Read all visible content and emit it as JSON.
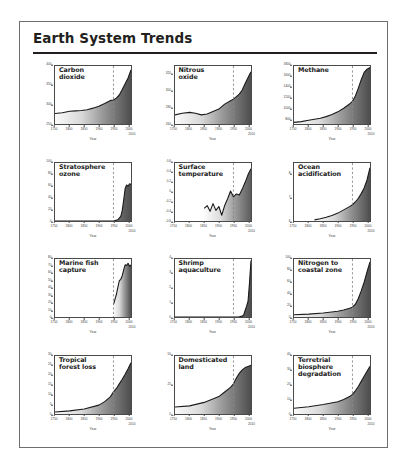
{
  "panel": {
    "title": "Earth System Trends"
  },
  "axis_common": {
    "xlabel": "Year",
    "xticks": [
      "1750",
      "1800",
      "1850",
      "1900",
      "1950",
      "2000"
    ],
    "xtick_values": [
      1750,
      1800,
      1850,
      1900,
      1950,
      2000
    ],
    "xlim": [
      1750,
      2010
    ],
    "x_end_label": "2010",
    "acceleration_marker_year": 1950
  },
  "chart_data": [
    {
      "type": "area",
      "title": "Carbon\ndioxide",
      "ylabel": "Atmospheric conc., ppm",
      "xlabel": "Year",
      "ylim": [
        250,
        400
      ],
      "yticks": [
        250,
        300,
        350,
        400
      ],
      "xlim": [
        1750,
        2010
      ],
      "x": [
        1750,
        1775,
        1800,
        1820,
        1840,
        1860,
        1880,
        1900,
        1920,
        1940,
        1950,
        1960,
        1970,
        1980,
        1990,
        2000,
        2010
      ],
      "values": [
        277,
        279,
        283,
        284,
        285,
        287,
        291,
        296,
        303,
        311,
        312,
        317,
        325,
        339,
        354,
        369,
        390
      ],
      "grid": false
    },
    {
      "type": "area",
      "title": "Nitrous\noxide",
      "ylabel": "Atmospheric conc., ppb",
      "xlabel": "Year",
      "ylim": [
        260,
        330
      ],
      "yticks": [
        260,
        280,
        300,
        320
      ],
      "xlim": [
        1750,
        2010
      ],
      "x": [
        1750,
        1775,
        1800,
        1820,
        1840,
        1860,
        1880,
        1900,
        1920,
        1940,
        1950,
        1960,
        1970,
        1980,
        1990,
        2000,
        2010
      ],
      "values": [
        271,
        273,
        274,
        273,
        271,
        272,
        275,
        278,
        284,
        288,
        290,
        293,
        296,
        301,
        309,
        316,
        323
      ],
      "grid": false
    },
    {
      "type": "area",
      "title": "Methane",
      "ylabel": "Atmospheric conc., ppb",
      "xlabel": "Year",
      "ylim": [
        700,
        1800
      ],
      "yticks": [
        800,
        1000,
        1200,
        1400,
        1600,
        1800
      ],
      "xlim": [
        1750,
        2010
      ],
      "x": [
        1750,
        1775,
        1800,
        1820,
        1840,
        1860,
        1880,
        1900,
        1920,
        1940,
        1950,
        1960,
        1970,
        1980,
        1990,
        2000,
        2010
      ],
      "values": [
        730,
        745,
        770,
        790,
        810,
        840,
        880,
        930,
        1000,
        1080,
        1130,
        1230,
        1380,
        1540,
        1680,
        1740,
        1770
      ],
      "grid": false
    },
    {
      "type": "area",
      "title": "Stratosphere\nozone",
      "ylabel": "% loss",
      "xlabel": "Year",
      "ylim": [
        0,
        100
      ],
      "yticks": [
        0,
        20,
        40,
        60,
        80,
        100
      ],
      "xlim": [
        1750,
        2010
      ],
      "x": [
        1750,
        1900,
        1950,
        1965,
        1975,
        1980,
        1985,
        1990,
        1995,
        2000,
        2005,
        2010
      ],
      "values": [
        0,
        0,
        0,
        2,
        8,
        18,
        36,
        56,
        62,
        60,
        64,
        63
      ],
      "grid": false
    },
    {
      "type": "line",
      "title": "Surface\ntemperature",
      "ylabel": "Temperature anomaly °C",
      "xlabel": "Year",
      "ylim": [
        -0.6,
        0.6
      ],
      "yticks": [
        -0.6,
        -0.4,
        -0.2,
        0.0,
        0.2,
        0.4,
        0.6
      ],
      "xlim": [
        1750,
        2010
      ],
      "x": [
        1850,
        1860,
        1870,
        1880,
        1890,
        1900,
        1910,
        1920,
        1930,
        1940,
        1950,
        1960,
        1970,
        1980,
        1990,
        2000,
        2010
      ],
      "values": [
        -0.34,
        -0.28,
        -0.4,
        -0.24,
        -0.38,
        -0.3,
        -0.48,
        -0.28,
        -0.14,
        0.02,
        -0.1,
        -0.04,
        -0.06,
        0.06,
        0.2,
        0.36,
        0.48
      ],
      "grid": false
    },
    {
      "type": "area",
      "title": "Ocean\nacidification",
      "ylabel": "Hydrogen ion, nmol kg⁻¹",
      "xlabel": "Year",
      "ylim": [
        6.0,
        8.5
      ],
      "yticks": [
        6.0,
        7.0,
        8.0
      ],
      "xlim": [
        1750,
        2010
      ],
      "x": [
        1820,
        1840,
        1860,
        1880,
        1900,
        1920,
        1940,
        1950,
        1960,
        1970,
        1980,
        1990,
        2000,
        2010
      ],
      "values": [
        6.05,
        6.1,
        6.16,
        6.24,
        6.34,
        6.48,
        6.62,
        6.7,
        6.82,
        6.98,
        7.18,
        7.42,
        7.78,
        8.3
      ],
      "grid": false
    },
    {
      "type": "area",
      "title": "Marine fish\ncapture",
      "ylabel": "Million tonnes",
      "xlabel": "Year",
      "ylim": [
        0,
        80
      ],
      "yticks": [
        0,
        10,
        20,
        30,
        40,
        50,
        60,
        70,
        80
      ],
      "xlim": [
        1750,
        2010
      ],
      "x": [
        1950,
        1955,
        1960,
        1965,
        1970,
        1975,
        1980,
        1985,
        1990,
        1995,
        2000,
        2005,
        2010
      ],
      "values": [
        17,
        24,
        31,
        41,
        50,
        52,
        57,
        65,
        72,
        71,
        74,
        70,
        72
      ],
      "grid": false
    },
    {
      "type": "area",
      "title": "Shrimp\naquaculture",
      "ylabel": "Million tonnes",
      "xlabel": "Year",
      "ylim": [
        0,
        4
      ],
      "yticks": [
        0,
        1,
        2,
        3,
        4
      ],
      "xlim": [
        1750,
        2010
      ],
      "x": [
        1750,
        1900,
        1950,
        1970,
        1980,
        1985,
        1990,
        1995,
        2000,
        2005,
        2010
      ],
      "values": [
        0,
        0,
        0,
        0.02,
        0.06,
        0.15,
        0.45,
        0.75,
        1.1,
        2.4,
        3.9
      ],
      "grid": false
    },
    {
      "type": "area",
      "title": "Nitrogen to\ncoastal zone",
      "ylabel": "Human N flux, Mton yr⁻¹",
      "xlabel": "Year",
      "ylim": [
        0,
        100
      ],
      "yticks": [
        0,
        20,
        40,
        60,
        80,
        100
      ],
      "xlim": [
        1750,
        2010
      ],
      "x": [
        1750,
        1800,
        1850,
        1900,
        1920,
        1940,
        1950,
        1960,
        1970,
        1980,
        1990,
        2000,
        2010
      ],
      "values": [
        4,
        5,
        7,
        10,
        12,
        15,
        17,
        22,
        32,
        45,
        60,
        78,
        95
      ],
      "grid": false
    },
    {
      "type": "area",
      "title": "Tropical\nforest loss",
      "ylabel": "% loss (area)",
      "xlabel": "Year",
      "ylim": [
        0,
        30
      ],
      "yticks": [
        0,
        5,
        10,
        15,
        20,
        25,
        30
      ],
      "xlim": [
        1750,
        2010
      ],
      "x": [
        1750,
        1800,
        1850,
        1900,
        1920,
        1940,
        1950,
        1960,
        1970,
        1980,
        1990,
        2000,
        2010
      ],
      "values": [
        1,
        1.6,
        2.6,
        4.6,
        6.4,
        9.0,
        11.5,
        13.2,
        15.6,
        18.0,
        20.6,
        23.4,
        26.5
      ],
      "grid": false
    },
    {
      "type": "area",
      "title": "Domesticated\nland",
      "ylabel": "% of total land area",
      "xlabel": "Year",
      "ylim": [
        0,
        50
      ],
      "yticks": [
        0,
        25,
        50
      ],
      "xlim": [
        1750,
        2010
      ],
      "x": [
        1750,
        1800,
        1850,
        1900,
        1920,
        1940,
        1950,
        1960,
        1970,
        1980,
        1990,
        2000,
        2010
      ],
      "values": [
        6,
        7,
        10,
        15,
        19,
        23,
        26,
        31,
        35,
        38,
        40,
        41,
        42
      ],
      "grid": false
    },
    {
      "type": "area",
      "title": "Terretrial\nbiosphere\ndegradation",
      "ylabel": "% mean species abundance",
      "xlabel": "Year",
      "ylim": [
        0,
        40
      ],
      "yticks": [
        0,
        10,
        20,
        30,
        40
      ],
      "xlim": [
        1750,
        2010
      ],
      "x": [
        1750,
        1800,
        1850,
        1900,
        1920,
        1940,
        1950,
        1960,
        1970,
        1980,
        1990,
        2000,
        2010
      ],
      "values": [
        4,
        5,
        6.5,
        8.5,
        10,
        12,
        13.5,
        16,
        19,
        22.5,
        26,
        29.5,
        33
      ],
      "grid": false
    }
  ]
}
